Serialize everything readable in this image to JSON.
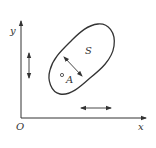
{
  "figure": {
    "labels": {
      "origin": "O",
      "x_axis": "x",
      "y_axis": "y",
      "region": "S",
      "point": "A"
    },
    "colors": {
      "stroke": "#333333",
      "background": "#ffffff"
    }
  }
}
